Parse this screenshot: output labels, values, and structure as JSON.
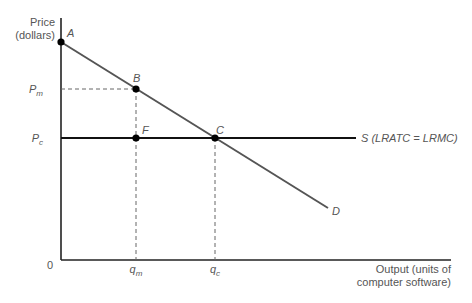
{
  "diagram": {
    "y_axis": {
      "label_line1": "Price",
      "label_line2": "(dollars)"
    },
    "x_axis": {
      "label_line1": "Output (units of",
      "label_line2": "computer software)"
    },
    "origin_label": "0",
    "price_ticks": [
      {
        "main": "P",
        "sub": "m"
      },
      {
        "main": "P",
        "sub": "c"
      }
    ],
    "quantity_ticks": [
      {
        "main": "q",
        "sub": "m"
      },
      {
        "main": "q",
        "sub": "c"
      }
    ],
    "points": {
      "A": "A",
      "B": "B",
      "C": "C",
      "F": "F"
    },
    "curves": {
      "demand": "D",
      "supply": "S (LRATC = LRMC)"
    },
    "colors": {
      "axis": "#222222",
      "demand_line": "#555555",
      "supply_line": "#111111",
      "dashed": "#666666",
      "point": "#000000"
    }
  }
}
